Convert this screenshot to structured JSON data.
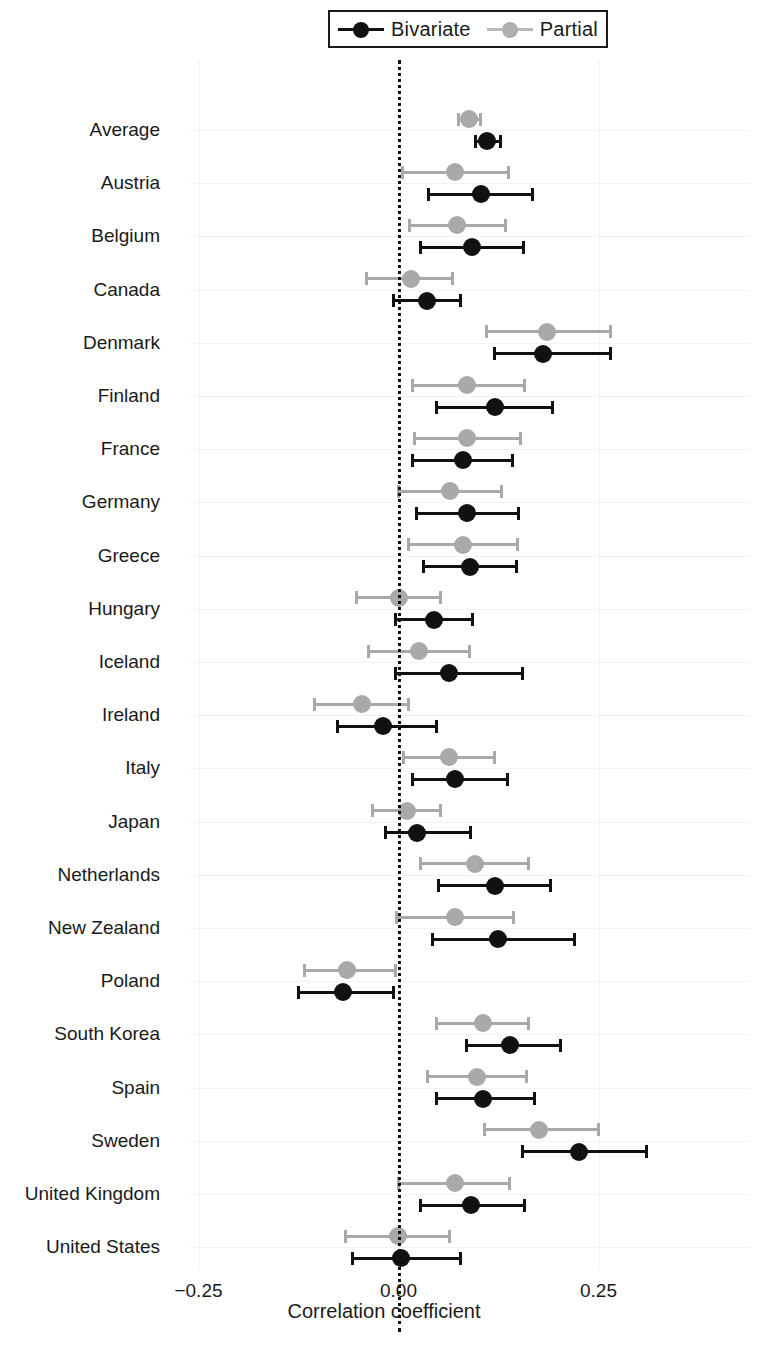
{
  "chart_data": {
    "type": "scatter",
    "title": "",
    "xlabel": "Correlation coefficient",
    "ylabel": "",
    "xlim": [
      -0.33,
      0.36
    ],
    "xticks": [
      -0.25,
      0.0,
      0.25
    ],
    "xticklabels": [
      "−0.25",
      "0.00",
      "0.25"
    ],
    "grid": true,
    "reference_line": 0.0,
    "legend_position": "top",
    "legend": [
      "Bivariate",
      "Partial"
    ],
    "categories": [
      "Average",
      "Austria",
      "Belgium",
      "Canada",
      "Denmark",
      "Finland",
      "France",
      "Germany",
      "Greece",
      "Hungary",
      "Iceland",
      "Ireland",
      "Italy",
      "Japan",
      "Netherlands",
      "New Zealand",
      "Poland",
      "South Korea",
      "Spain",
      "Sweden",
      "United Kingdom",
      "United States"
    ],
    "series": [
      {
        "name": "Bivariate",
        "color": "#111111",
        "values": [
          0.111,
          0.103,
          0.092,
          0.035,
          0.18,
          0.12,
          0.08,
          0.085,
          0.089,
          0.044,
          0.063,
          -0.02,
          0.071,
          0.023,
          0.12,
          0.124,
          -0.069,
          0.139,
          0.106,
          0.226,
          0.09,
          0.003
        ],
        "ci_lower": [
          0.096,
          0.038,
          0.028,
          -0.006,
          0.12,
          0.047,
          0.017,
          0.022,
          0.031,
          -0.004,
          -0.004,
          -0.076,
          0.018,
          -0.016,
          0.05,
          0.043,
          -0.125,
          0.085,
          0.048,
          0.155,
          0.027,
          -0.058
        ],
        "ci_upper": [
          0.127,
          0.168,
          0.156,
          0.077,
          0.265,
          0.193,
          0.143,
          0.15,
          0.148,
          0.093,
          0.155,
          0.047,
          0.136,
          0.09,
          0.19,
          0.22,
          -0.006,
          0.203,
          0.17,
          0.31,
          0.158,
          0.077
        ]
      },
      {
        "name": "Partial",
        "color": "#a9a9a9",
        "values": [
          0.088,
          0.07,
          0.073,
          0.015,
          0.185,
          0.086,
          0.086,
          0.064,
          0.08,
          0.0,
          0.025,
          -0.046,
          0.063,
          0.01,
          0.095,
          0.071,
          -0.064,
          0.105,
          0.098,
          0.175,
          0.07,
          -0.001
        ],
        "ci_lower": [
          0.075,
          0.005,
          0.014,
          -0.04,
          0.11,
          0.018,
          0.02,
          0.0,
          0.012,
          -0.053,
          -0.038,
          -0.105,
          0.006,
          -0.032,
          0.027,
          -0.002,
          -0.118,
          0.048,
          0.036,
          0.107,
          0.0,
          -0.066
        ],
        "ci_upper": [
          0.103,
          0.137,
          0.134,
          0.068,
          0.265,
          0.157,
          0.153,
          0.129,
          0.149,
          0.052,
          0.089,
          0.012,
          0.12,
          0.052,
          0.163,
          0.144,
          -0.004,
          0.163,
          0.16,
          0.25,
          0.139,
          0.064
        ]
      }
    ]
  }
}
